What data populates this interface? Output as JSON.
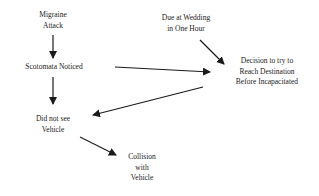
{
  "diagram": {
    "nodes": [
      {
        "id": "migraine",
        "lines": [
          "Migraine",
          "Attack"
        ]
      },
      {
        "id": "scotomata",
        "lines": [
          "Scotomata Noticed"
        ]
      },
      {
        "id": "wedding",
        "lines": [
          "Due at Wedding",
          "in One Hour"
        ]
      },
      {
        "id": "decision",
        "lines": [
          "Decision to try to",
          "Reach Destination",
          "Before Incapacitated"
        ]
      },
      {
        "id": "didnotsee",
        "lines": [
          "Did not see",
          "Vehicle"
        ]
      },
      {
        "id": "collision",
        "lines": [
          "Collision",
          "with",
          "Vehicle"
        ]
      }
    ],
    "edges": [
      {
        "from": "migraine",
        "to": "scotomata"
      },
      {
        "from": "scotomata",
        "to": "didnotsee"
      },
      {
        "from": "scotomata",
        "to": "decision"
      },
      {
        "from": "wedding",
        "to": "decision"
      },
      {
        "from": "decision",
        "to": "didnotsee"
      },
      {
        "from": "didnotsee",
        "to": "collision"
      }
    ],
    "colors": {
      "line": "#1a1a1a",
      "background": "#ffffff"
    }
  }
}
